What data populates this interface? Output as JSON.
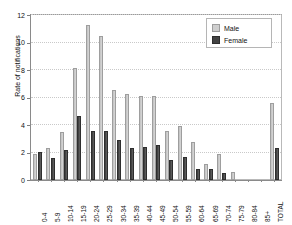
{
  "chart_data": {
    "type": "bar",
    "title": "",
    "subtitle": "",
    "xlabel": "",
    "ylabel": "Rate of notifications",
    "ylim": [
      0,
      12
    ],
    "yticks": [
      0,
      2,
      4,
      6,
      8,
      10,
      12
    ],
    "ytick_labels": [
      "0",
      "2",
      "4",
      "6",
      "8",
      "10",
      "12"
    ],
    "grid": true,
    "legend_position": "top-right",
    "categories": [
      "0-4",
      "5-9",
      "10-14",
      "15-19",
      "20-24",
      "25-29",
      "30-34",
      "35-39",
      "40-44",
      "45-49",
      "50-54",
      "55-59",
      "60-64",
      "65-69",
      "70-74",
      "75-79",
      "80-84",
      "85+",
      "TOTAL"
    ],
    "series": [
      {
        "name": "Male",
        "color": "#cfcfcf",
        "values": [
          1.9,
          2.3,
          3.5,
          8.15,
          11.3,
          10.5,
          6.55,
          6.25,
          6.1,
          6.1,
          3.55,
          3.95,
          2.75,
          1.2,
          1.9,
          0.6,
          0.0,
          0.0,
          5.6
        ]
      },
      {
        "name": "Female",
        "color": "#434343",
        "values": [
          2.05,
          1.6,
          2.15,
          4.65,
          3.6,
          3.6,
          2.9,
          2.3,
          2.4,
          2.55,
          1.45,
          1.65,
          0.8,
          0.8,
          0.5,
          0.0,
          0.0,
          0.0,
          2.35
        ]
      }
    ]
  },
  "legend": {
    "items": [
      {
        "label": "Male",
        "swatch": "male-swatch"
      },
      {
        "label": "Female",
        "swatch": "female-swatch"
      }
    ]
  }
}
